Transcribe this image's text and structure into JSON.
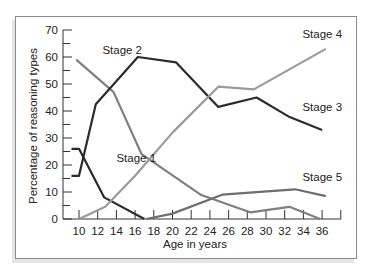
{
  "chart_data": {
    "type": "line",
    "title": "",
    "xlabel": "Age in years",
    "ylabel": "Percentage of reasoning types",
    "xlim": [
      9,
      38
    ],
    "ylim": [
      0,
      70
    ],
    "x_ticks": [
      10,
      12,
      14,
      16,
      18,
      20,
      22,
      24,
      26,
      28,
      30,
      32,
      34,
      36
    ],
    "y_ticks": [
      0,
      10,
      20,
      30,
      40,
      50,
      60,
      70
    ],
    "grid": false,
    "legend": "inline labels",
    "series": [
      {
        "name": "Stage 1",
        "color": "#2b2b2b",
        "x": [
          9.2,
          10,
          12.7,
          17.0
        ],
        "y": [
          26,
          26,
          8,
          0
        ]
      },
      {
        "name": "Stage 2",
        "color": "#7f7f7f",
        "x": [
          9.7,
          13.7,
          16.7,
          23.0,
          28.3,
          32.5,
          35.8
        ],
        "y": [
          59,
          47,
          24,
          9,
          2.5,
          4.5,
          0
        ]
      },
      {
        "name": "Stage 3",
        "color": "#2b2b2b",
        "x": [
          9.2,
          10,
          11.8,
          16.3,
          20.4,
          24.9,
          29.0,
          32.4,
          36.0
        ],
        "y": [
          16,
          16,
          42.5,
          60,
          58,
          41.5,
          45,
          38,
          33
        ]
      },
      {
        "name": "Stage 4",
        "color": "#9a9a9a",
        "x": [
          10,
          12.8,
          16,
          20,
          24.9,
          28.7,
          36.4
        ],
        "y": [
          0,
          4.5,
          16,
          32,
          49,
          48,
          63
        ]
      },
      {
        "name": "Stage 5",
        "color": "#6e6e6e",
        "x": [
          17.2,
          20.0,
          25.3,
          33.1,
          36.4
        ],
        "y": [
          0,
          2,
          9,
          11,
          8.5
        ]
      }
    ],
    "labels": [
      {
        "text": "Stage 1",
        "x": 14,
        "y": 21
      },
      {
        "text": "Stage 2",
        "x": 12.5,
        "y": 61
      },
      {
        "text": "Stage 3",
        "x": 33.9,
        "y": 40
      },
      {
        "text": "Stage 4",
        "x": 33.9,
        "y": 67
      },
      {
        "text": "Stage 5",
        "x": 33.9,
        "y": 14
      }
    ]
  }
}
